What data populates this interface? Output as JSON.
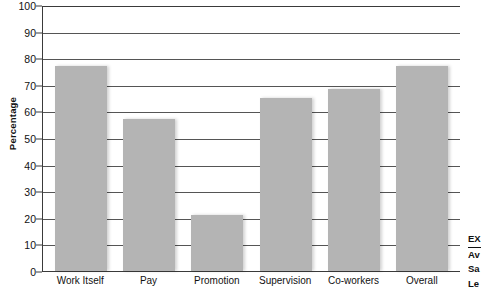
{
  "chart_data": {
    "type": "bar",
    "title": "",
    "xlabel": "",
    "ylabel": "Percentage",
    "ylim": [
      0,
      100
    ],
    "yticks": [
      0,
      10,
      20,
      30,
      40,
      50,
      60,
      70,
      80,
      90,
      100
    ],
    "grid": true,
    "legend": "none",
    "bar_color": "#b4b4b4",
    "axis_color": "#3a3a3a",
    "categories": [
      "Work Itself",
      "Pay",
      "Promotion",
      "Supervision",
      "Co-workers",
      "Overall"
    ],
    "values": [
      77,
      57,
      21,
      65,
      68.5,
      77
    ]
  },
  "axis": {
    "y_title": "Percentage",
    "y_tick_labels": [
      "100",
      "90",
      "80",
      "70",
      "60",
      "50",
      "40",
      "30",
      "20",
      "10",
      "0"
    ],
    "x_tick_labels": [
      "Work Itself",
      "Pay",
      "Promotion",
      "Supervision",
      "Co-workers",
      "Overall"
    ]
  },
  "sidenote": {
    "lines": [
      "EX",
      "Av",
      "Sa",
      "Le"
    ]
  }
}
